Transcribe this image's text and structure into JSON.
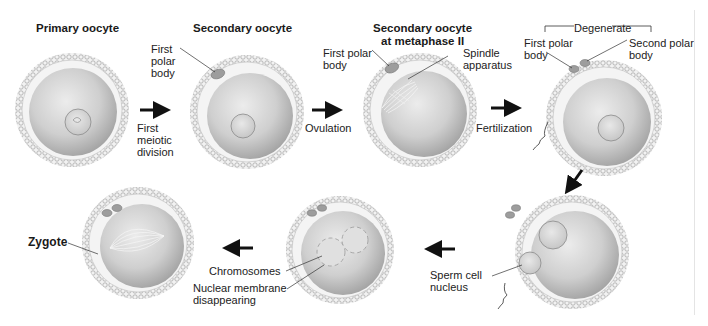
{
  "stages": [
    {
      "id": "primary-oocyte",
      "title": "Primary oocyte"
    },
    {
      "id": "secondary-oocyte",
      "title": "Secondary oocyte",
      "labels": [
        "First\npolar\nbody"
      ]
    },
    {
      "id": "secondary-oocyte-metaphase-ii",
      "title": "Secondary oocyte\nat metaphase II",
      "labels": [
        "First polar\nbody",
        "Spindle\napparatus"
      ]
    },
    {
      "id": "fertilized-oocyte",
      "bracket_label": "Degenerate",
      "labels": [
        "First polar\nbody",
        "Second polar\nbody"
      ]
    },
    {
      "id": "pronuclei",
      "labels": [
        "Sperm cell\nnucleus"
      ]
    },
    {
      "id": "membranes-disappearing",
      "labels": [
        "Chromosomes",
        "Nuclear membrane\ndisappearing"
      ]
    },
    {
      "id": "zygote",
      "title": "Zygote"
    }
  ],
  "transitions": [
    {
      "from": "primary-oocyte",
      "to": "secondary-oocyte",
      "label": "First\nmeiotic\ndivision",
      "direction": "right"
    },
    {
      "from": "secondary-oocyte",
      "to": "secondary-oocyte-metaphase-ii",
      "label": "Ovulation",
      "direction": "right"
    },
    {
      "from": "secondary-oocyte-metaphase-ii",
      "to": "fertilized-oocyte",
      "label": "Fertilization",
      "direction": "right"
    },
    {
      "from": "fertilized-oocyte",
      "to": "pronuclei",
      "label": "",
      "direction": "down-left"
    },
    {
      "from": "pronuclei",
      "to": "membranes-disappearing",
      "label": "",
      "direction": "left"
    },
    {
      "from": "membranes-disappearing",
      "to": "zygote",
      "label": "",
      "direction": "left"
    }
  ],
  "colors": {
    "cytoplasm_light": "#e6e6e6",
    "cytoplasm_dark": "#9e9e9e",
    "zona": "#f0f0f0",
    "corona": "#c8c8c8",
    "arrow": "#111111",
    "leader": "#333333"
  }
}
